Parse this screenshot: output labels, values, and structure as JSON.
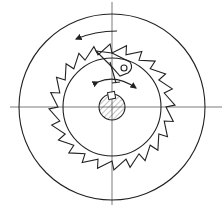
{
  "diagram": {
    "colors": {
      "line": "#222222",
      "background": "#ffffff"
    },
    "center": [
      112,
      107
    ],
    "outer_circle_radius": 93,
    "ratchet": {
      "tip_radius": 63,
      "root_radius": 54,
      "teeth": 24
    },
    "inner_circle_radius": 49,
    "hub_radius": 13,
    "components": [
      {
        "id": "outer-housing",
        "label": "housing circle"
      },
      {
        "id": "ratchet-wheel",
        "label": "ratchet wheel with teeth"
      },
      {
        "id": "pawl",
        "label": "pawl with pivot pin"
      },
      {
        "id": "shaft",
        "label": "hatched shaft with key"
      },
      {
        "id": "rotation-arrow",
        "label": "counter-clockwise rotation arrow"
      },
      {
        "id": "swing-arrow",
        "label": "pawl swing arrow"
      }
    ]
  }
}
